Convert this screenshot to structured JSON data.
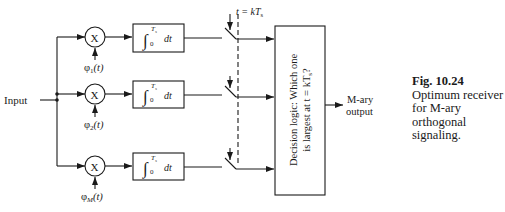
{
  "diagram": {
    "input_label": "Input",
    "multiplier_symbol": "X",
    "branches": [
      {
        "basis_phi": "φ",
        "basis_sub": "1",
        "basis_arg": "(t)",
        "integrator_upper": "T",
        "integrator_upper_sub": "s",
        "integrator_lower": "0",
        "integrator_dt": "dt"
      },
      {
        "basis_phi": "φ",
        "basis_sub": "2",
        "basis_arg": "(t)",
        "integrator_upper": "T",
        "integrator_upper_sub": "s",
        "integrator_lower": "0",
        "integrator_dt": "dt"
      },
      {
        "basis_phi": "φ",
        "basis_sub": "M",
        "basis_arg": "(t)",
        "integrator_upper": "T",
        "integrator_upper_sub": "s",
        "integrator_lower": "0",
        "integrator_dt": "dt"
      }
    ],
    "sampler_label": "t = kT",
    "sampler_label_sub": "s",
    "decision_line1": "Decision logic: Which one",
    "decision_line2": "is largest at t = kT",
    "decision_line2_sub": "s",
    "decision_line2_end": "?",
    "output_line1": "M-ary",
    "output_line2": "output"
  },
  "caption": {
    "fig": "Fig. 10.24",
    "lines": [
      "Optimum receiver",
      "for M-ary",
      "orthogonal",
      "signaling."
    ]
  }
}
